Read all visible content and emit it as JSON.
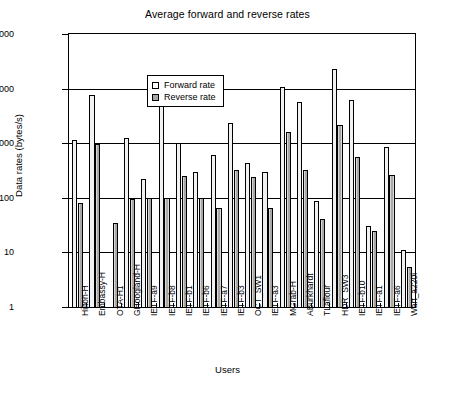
{
  "chart_data": {
    "type": "bar",
    "title": "Average forward and reverse rates",
    "xlabel": "Users",
    "ylabel": "Data rates (bytes/s)",
    "yscale": "log",
    "ylim": [
      1,
      100000
    ],
    "ytick_labels": [
      "100000",
      "10000",
      "1000",
      "100",
      "10",
      "1"
    ],
    "ytick_values": [
      100000,
      10000,
      1000,
      100,
      10,
      1
    ],
    "grid": true,
    "legend_position": "top-left",
    "categories": [
      "Hilton-H",
      "Embassy-H",
      "OTA-H1",
      "GHoogland-H",
      "IETF-a9",
      "IETF-b8",
      "IETF-b1",
      "IETF-b6",
      "IETF-a7",
      "IETF-b3",
      "OCT_SW1",
      "IETF-a3",
      "MGrab-H",
      "ABurkhardt",
      "TLaflour",
      "HDR_SW3",
      "IETF-b10",
      "IETF-a1",
      "IETF-a6",
      "Wart_a220i"
    ],
    "series": [
      {
        "name": "Forward rate",
        "color": "#f2f2f2",
        "values": [
          1150,
          7800,
          null,
          1250,
          220,
          9500,
          1000,
          300,
          600,
          2350,
          440,
          300,
          10500,
          5600,
          88,
          23000,
          6200,
          30,
          850,
          11
        ]
      },
      {
        "name": "Reverse rate",
        "color": "#a8a8a8",
        "values": [
          80,
          950,
          35,
          95,
          100,
          100,
          250,
          100,
          65,
          320,
          240,
          65,
          1600,
          330,
          41,
          2200,
          570,
          25,
          260,
          5.5
        ]
      }
    ]
  },
  "legend": {
    "items": [
      {
        "label": "Forward rate",
        "key": "forward"
      },
      {
        "label": "Reverse rate",
        "key": "reverse"
      }
    ]
  }
}
